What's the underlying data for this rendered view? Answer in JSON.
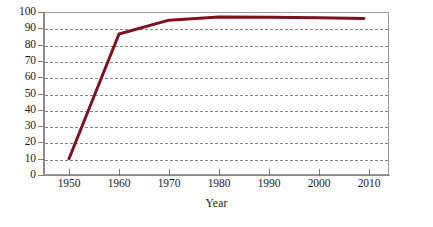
{
  "chart_data": {
    "type": "line",
    "title": "",
    "xlabel": "Year",
    "ylabel": "",
    "x": [
      1950,
      1960,
      1970,
      1980,
      1990,
      2000,
      2009
    ],
    "values": [
      10,
      86.5,
      95,
      97,
      96.8,
      96.5,
      96
    ],
    "series": [
      {
        "name": "",
        "color": "#7b1220",
        "x": [
          1950,
          1960,
          1970,
          1980,
          1990,
          2000,
          2009
        ],
        "values": [
          10,
          86.5,
          95,
          97,
          96.8,
          96.5,
          96
        ]
      }
    ],
    "xlim": [
      1945,
      2014
    ],
    "ylim": [
      0,
      100
    ],
    "y_ticks": [
      0,
      10,
      20,
      30,
      40,
      50,
      60,
      70,
      80,
      90,
      100
    ],
    "y_tick_labels": [
      "0",
      "10",
      "20",
      "30",
      "40",
      "50",
      "60",
      "70",
      "80",
      "90",
      "100"
    ],
    "x_ticks": [
      1950,
      1960,
      1970,
      1980,
      1990,
      2000,
      2010
    ],
    "x_tick_labels": [
      "1950",
      "1960",
      "1970",
      "1980",
      "1990",
      "2000",
      "2010"
    ],
    "grid": {
      "horizontal": true,
      "vertical": false,
      "style": "dashed",
      "color": "#6f6f6f"
    },
    "legend": {
      "visible": false,
      "position": "none",
      "entries": []
    },
    "annotations": [],
    "line_width": 3,
    "markers": false,
    "frame_color": "#9a9a9a",
    "background": "#ffffff"
  },
  "axes": {
    "x_title": "Year",
    "y_title": ""
  }
}
